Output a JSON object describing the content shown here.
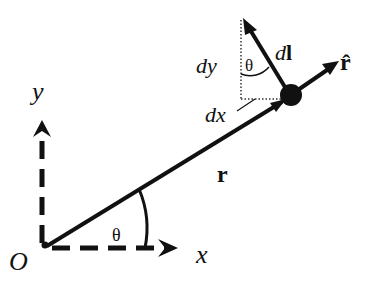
{
  "diagram": {
    "labels": {
      "origin": "O",
      "x_axis": "x",
      "y_axis": "y",
      "position_vector": "r",
      "unit_vector": "r̂",
      "angle_origin": "θ",
      "angle_element": "θ",
      "line_element_d": "d",
      "line_element_l": "l",
      "dx": "dx",
      "dy": "dy"
    },
    "colors": {
      "stroke": "#111111",
      "background": "#ffffff"
    }
  }
}
